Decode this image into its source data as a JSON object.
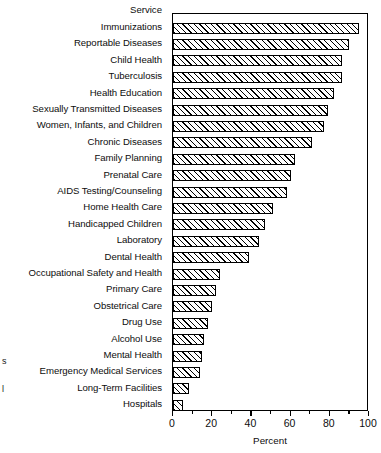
{
  "chart_data": {
    "type": "bar",
    "orientation": "horizontal",
    "title": "",
    "xlabel": "Percent",
    "ylabel": "Service",
    "xlim": [
      0,
      100
    ],
    "grid": false,
    "legend": null,
    "xticks": [
      0,
      20,
      40,
      60,
      80,
      100
    ],
    "xtick_labels": [
      "0",
      "20",
      "40",
      "60",
      "80",
      "100"
    ],
    "minor_tick_interval": 10,
    "categories": [
      "Immunizations",
      "Reportable Diseases",
      "Child Health",
      "Tuberculosis",
      "Health Education",
      "Sexually Transmitted Diseases",
      "Women, Infants, and Children",
      "Chronic Diseases",
      "Family Planning",
      "Prenatal Care",
      "AIDS Testing/Counseling",
      "Home Health Care",
      "Handicapped Children",
      "Laboratory",
      "Dental Health",
      "Occupational Safety and Health",
      "Primary Care",
      "Obstetrical Care",
      "Drug Use",
      "Alcohol Use",
      "Mental Health",
      "Emergency Medical Services",
      "Long-Term Facilities",
      "Hospitals"
    ],
    "values": [
      95,
      90,
      86,
      86,
      82,
      79,
      77,
      71,
      62,
      60,
      58,
      51,
      47,
      44,
      39,
      24,
      22,
      20,
      18,
      16,
      15,
      14,
      8,
      5
    ]
  },
  "axes": {
    "y_header": "Service",
    "x_title": "Percent"
  },
  "edge_fragments": [
    {
      "text": "s",
      "top": 356
    },
    {
      "text": "l",
      "top": 384
    }
  ]
}
